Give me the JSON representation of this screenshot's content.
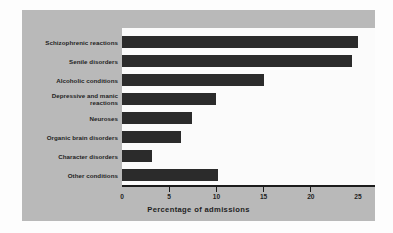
{
  "chart_data": {
    "type": "bar",
    "orientation": "horizontal",
    "title": "",
    "xlabel": "Percentage of admissions",
    "ylabel": "",
    "categories": [
      "Schizophrenic reactions",
      "Senile disorders",
      "Alcoholic conditions",
      "Depressive and manic reactions",
      "Neuroses",
      "Organic brain disorders",
      "Character disorders",
      "Other conditions"
    ],
    "values": [
      25.0,
      24.4,
      15.0,
      10.0,
      7.4,
      6.2,
      3.2,
      10.2
    ],
    "xlim": [
      0,
      25
    ],
    "xticks": [
      0,
      5,
      10,
      15,
      20,
      25
    ],
    "xtick_labels": [
      "0",
      "5",
      "10",
      "15",
      "20",
      "25"
    ],
    "grid": false,
    "legend": null,
    "bar_color": "#2b2b2b",
    "plot_background": "#fbfbfb",
    "panel_background": "#b9b9b9",
    "text_color": "#1f1f1f"
  },
  "labels": {
    "cat0_line1": "Schizophrenic reactions",
    "cat1_line1": "Senile disorders",
    "cat2_line1": "Alcoholic conditions",
    "cat3_line1": "Depressive and manic",
    "cat3_line2": "reactions",
    "cat4_line1": "Neuroses",
    "cat5_line1": "Organic brain disorders",
    "cat6_line1": "Character disorders",
    "cat7_line1": "Other conditions"
  }
}
